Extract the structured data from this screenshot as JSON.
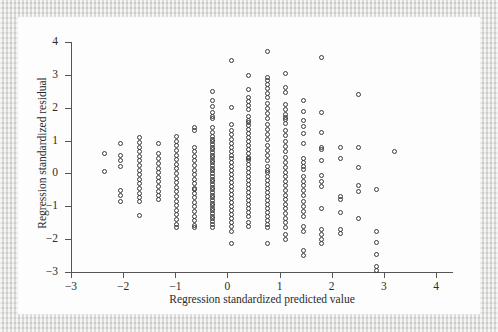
{
  "figure": {
    "kind": "scatterplot",
    "background_color": "#fdfdfd",
    "page_border_color": "#dcdcda",
    "marker_color": "#3a3a3a",
    "axis_color": "#555555",
    "text_color": "#2b2b2b"
  },
  "chart_data": {
    "type": "scatter",
    "title": "",
    "subtitle": "",
    "xlabel": "Regression standardized predicted value",
    "ylabel": "Regression standardized residual",
    "xlim": [
      -3,
      4
    ],
    "ylim": [
      -3,
      4
    ],
    "xticks": [
      -3,
      -2,
      -1,
      0,
      1,
      2,
      3,
      4
    ],
    "yticks": [
      -3,
      -2,
      -1,
      0,
      1,
      2,
      3,
      4
    ],
    "xtick_labels": [
      "−3",
      "−2",
      "−1",
      "0",
      "1",
      "2",
      "3",
      "4"
    ],
    "ytick_labels": [
      "−3",
      "−2",
      "−1",
      "0",
      "1",
      "2",
      "3",
      "4"
    ],
    "grid": false,
    "legend": null,
    "legend_position": "none",
    "marker": "open-circle",
    "marker_size_px": 5,
    "n_points": 421,
    "columns": [
      {
        "x": -2.35,
        "y": [
          0.62,
          0.05
        ]
      },
      {
        "x": -2.05,
        "y": [
          0.9,
          0.55,
          0.38,
          0.2,
          -0.52,
          -0.68,
          -0.85
        ]
      },
      {
        "x": -1.68,
        "y": [
          1.1,
          0.95,
          0.8,
          0.66,
          0.52,
          0.38,
          0.24,
          0.1,
          -0.04,
          -0.18,
          -0.32,
          -0.46,
          -0.6,
          -0.74,
          -0.86,
          -1.28
        ]
      },
      {
        "x": -1.33,
        "y": [
          0.92,
          0.62,
          0.46,
          0.3,
          0.16,
          0.02,
          -0.12,
          -0.26,
          -0.4,
          -0.54,
          -0.68,
          -0.8
        ]
      },
      {
        "x": -0.97,
        "y": [
          1.12,
          0.98,
          0.84,
          0.7,
          0.56,
          0.42,
          0.28,
          0.14,
          0.0,
          -0.14,
          -0.28,
          -0.42,
          -0.56,
          -0.7,
          -0.84,
          -0.98,
          -1.12,
          -1.26,
          -1.4,
          -1.54,
          -1.66
        ]
      },
      {
        "x": -0.63,
        "y": [
          1.4,
          1.3,
          0.8,
          0.66,
          0.52,
          0.38,
          0.24,
          0.1,
          -0.04,
          -0.18,
          -0.32,
          -0.46,
          -0.5,
          -0.6,
          -0.74,
          -0.88,
          -1.02,
          -1.16,
          -1.3,
          -1.44,
          -1.58,
          -1.66
        ]
      },
      {
        "x": -0.29,
        "y": [
          2.48,
          2.22,
          2.04,
          1.86,
          1.72,
          1.68,
          1.4,
          1.26,
          1.12,
          1.04,
          0.96,
          0.88,
          0.8,
          0.72,
          0.64,
          0.56,
          0.48,
          0.4,
          0.32,
          0.24,
          0.16,
          0.08,
          0.0,
          -0.1,
          -0.18,
          -0.26,
          -0.34,
          -0.42,
          -0.5,
          -0.58,
          -0.66,
          -0.74,
          -0.82,
          -0.9,
          -0.98,
          -1.06,
          -1.14,
          -1.22,
          -1.3,
          -1.38,
          -1.46,
          -1.56,
          -1.64
        ]
      },
      {
        "x": 0.07,
        "y": [
          3.44,
          2.02,
          1.5,
          1.32,
          1.18,
          1.04,
          0.92,
          0.8,
          0.68,
          0.56,
          0.44,
          0.32,
          0.2,
          0.08,
          -0.04,
          -0.16,
          -0.28,
          -0.4,
          -0.52,
          -0.64,
          -0.76,
          -0.88,
          -1.0,
          -1.12,
          -1.24,
          -1.36,
          -1.48,
          -1.62,
          -1.78,
          -2.14
        ]
      },
      {
        "x": 0.41,
        "y": [
          2.98,
          2.56,
          2.3,
          2.18,
          2.06,
          1.94,
          1.74,
          1.62,
          1.54,
          1.46,
          1.34,
          1.22,
          1.1,
          0.98,
          0.86,
          0.74,
          0.62,
          0.5,
          0.44,
          0.38,
          0.26,
          0.14,
          0.02,
          -0.1,
          -0.22,
          -0.34,
          -0.46,
          -0.58,
          -0.7,
          -0.82,
          -0.94,
          -1.06,
          -1.18,
          -1.32,
          -1.48,
          -1.62
        ]
      },
      {
        "x": 0.76,
        "y": [
          3.72,
          2.92,
          2.84,
          2.72,
          2.58,
          2.44,
          2.3,
          2.14,
          1.98,
          1.82,
          1.66,
          1.5,
          1.34,
          1.18,
          1.02,
          0.86,
          0.7,
          0.54,
          0.38,
          0.22,
          0.1,
          0.02,
          -0.1,
          -0.22,
          -0.34,
          -0.46,
          -0.58,
          -0.7,
          -0.82,
          -0.94,
          -1.06,
          -1.18,
          -1.3,
          -1.42,
          -1.54,
          -1.66,
          -2.14
        ]
      },
      {
        "x": 1.12,
        "y": [
          3.04,
          2.62,
          2.46,
          2.1,
          1.94,
          1.78,
          1.7,
          1.64,
          1.52,
          1.3,
          1.14,
          0.98,
          0.82,
          0.66,
          0.5,
          0.34,
          0.18,
          0.04,
          -0.1,
          -0.24,
          -0.38,
          -0.52,
          -0.66,
          -0.8,
          -0.94,
          -1.08,
          -1.22,
          -1.36,
          -1.5,
          -1.64,
          -1.86,
          -2.02
        ]
      },
      {
        "x": 1.46,
        "y": [
          2.22,
          1.88,
          1.6,
          1.42,
          1.22,
          0.92,
          0.44,
          0.32,
          0.22,
          0.12,
          -0.1,
          -0.24,
          -0.36,
          -0.52,
          -0.68,
          -0.84,
          -1.0,
          -1.16,
          -1.32,
          -1.62,
          -1.78,
          -2.36,
          -2.5
        ]
      },
      {
        "x": 1.81,
        "y": [
          3.52,
          1.84,
          1.24,
          0.8,
          0.72,
          0.38,
          -0.06,
          -0.26,
          -0.4,
          -1.06,
          -1.72,
          -1.86,
          -2.0,
          -2.14
        ]
      },
      {
        "x": 2.16,
        "y": [
          0.78,
          0.46,
          -0.7,
          -0.8,
          -1.18,
          -1.72,
          -1.84
        ]
      },
      {
        "x": 2.52,
        "y": [
          2.4,
          0.8,
          0.18,
          -0.38,
          -0.56,
          -1.38
        ]
      },
      {
        "x": 2.86,
        "y": [
          -0.5,
          -1.78,
          -2.1,
          -2.46,
          -2.84,
          -2.94
        ]
      },
      {
        "x": 3.2,
        "y": [
          0.66
        ]
      }
    ]
  }
}
